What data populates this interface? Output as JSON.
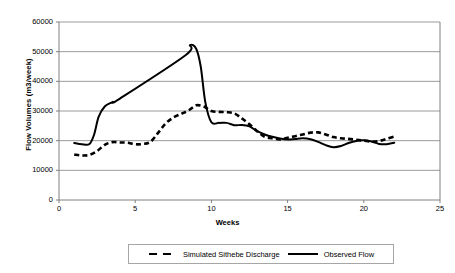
{
  "chart_data": {
    "type": "line",
    "title": "",
    "xlabel": "Weeks",
    "ylabel": "Flow Volumes (m3/week)",
    "xlim": [
      0,
      25
    ],
    "ylim": [
      0,
      60000
    ],
    "xticks": [
      0,
      5,
      10,
      15,
      20,
      25
    ],
    "yticks": [
      0,
      10000,
      20000,
      30000,
      40000,
      50000,
      60000
    ],
    "xtick_labels": [
      "0",
      "5",
      "10",
      "15",
      "20",
      "25"
    ],
    "ytick_labels": [
      "0",
      "10000",
      "20000",
      "30000",
      "40000",
      "50000",
      "60000"
    ],
    "grid": "horizontal",
    "legend_position": "bottom",
    "series": [
      {
        "name": "Simulated Sithebe Discharge",
        "style": "dashed",
        "color": "#000000",
        "x": [
          1,
          1.5,
          2,
          2.5,
          3,
          3.5,
          4,
          4.5,
          5,
          5.5,
          6,
          6.5,
          7,
          7.5,
          8,
          8.5,
          9,
          9.5,
          10,
          10.5,
          11,
          11.5,
          12,
          12.5,
          13,
          13.5,
          14,
          14.5,
          15,
          15.5,
          16,
          16.5,
          17,
          17.5,
          18,
          18.5,
          19,
          19.5,
          20,
          20.5,
          21,
          21.5,
          22
        ],
        "values": [
          15300,
          15000,
          15200,
          16500,
          18600,
          19500,
          19400,
          19300,
          18800,
          18900,
          19600,
          22600,
          25800,
          27800,
          29000,
          30200,
          31900,
          31500,
          30000,
          29700,
          29600,
          29200,
          27500,
          25500,
          23200,
          21300,
          20800,
          20400,
          21000,
          21500,
          22100,
          22700,
          22800,
          22100,
          21200,
          20800,
          20600,
          20300,
          20000,
          19700,
          19900,
          20600,
          21400
        ]
      },
      {
        "name": "Observed Flow",
        "style": "solid",
        "color": "#000000",
        "x": [
          1,
          1.5,
          2,
          2.3,
          2.6,
          3,
          3.5,
          4,
          8.3,
          8.6,
          9,
          9.3,
          9.6,
          10,
          10.5,
          11,
          11.5,
          12,
          12.5,
          13,
          13.5,
          14,
          14.5,
          15,
          15.5,
          16,
          16.5,
          17,
          17.5,
          18,
          18.5,
          19,
          19.5,
          20,
          20.5,
          21,
          21.5,
          22
        ],
        "values": [
          19200,
          18800,
          18900,
          22000,
          28000,
          31500,
          33000,
          34200,
          48800,
          52200,
          51000,
          45000,
          33000,
          26200,
          26000,
          26000,
          25200,
          25300,
          24800,
          23200,
          22100,
          21300,
          20700,
          20400,
          20600,
          20800,
          20500,
          19600,
          18500,
          17800,
          18200,
          19200,
          19900,
          20100,
          19700,
          18900,
          18800,
          19300
        ]
      }
    ]
  },
  "legend": {
    "items": [
      {
        "label": "Simulated Sithebe Discharge",
        "style": "dashed"
      },
      {
        "label": "Observed Flow",
        "style": "solid"
      }
    ]
  },
  "colors": {
    "axis": "#808080",
    "grid": "#808080",
    "line": "#000000",
    "legend_border": "#a6a6a6",
    "background": "#ffffff"
  }
}
